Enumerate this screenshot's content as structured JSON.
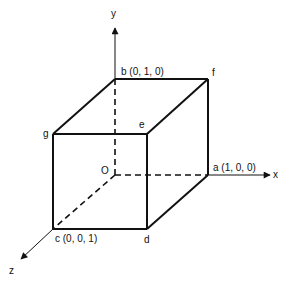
{
  "diagram": {
    "type": "unit-cube-axes",
    "colors": {
      "stroke": "#111111",
      "background": "#ffffff"
    },
    "axes": {
      "x": {
        "label": "x"
      },
      "y": {
        "label": "y"
      },
      "z": {
        "label": "z"
      },
      "origin": {
        "label": "O"
      }
    },
    "vertices": {
      "a": {
        "label": "a (1, 0, 0)"
      },
      "b": {
        "label": "b (0, 1, 0)"
      },
      "c": {
        "label": "c (0, 0, 1)"
      },
      "d": {
        "label": "d"
      },
      "e": {
        "label": "e"
      },
      "f": {
        "label": "f"
      },
      "g": {
        "label": "g"
      }
    }
  }
}
